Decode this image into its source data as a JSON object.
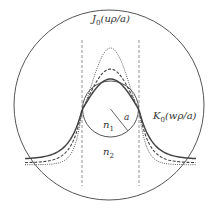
{
  "diagram": {
    "type": "optical-fiber-mode-field",
    "labels": {
      "bessel_j": {
        "main": "J",
        "sub": "0",
        "arg": "(uρ/a)"
      },
      "bessel_k": {
        "main": "K",
        "sub": "0",
        "arg": "(wρ/a)"
      },
      "radius": "a",
      "core_index": {
        "main": "n",
        "sub": "1"
      },
      "cladding_index": {
        "main": "n",
        "sub": "2"
      }
    },
    "curves": [
      {
        "name": "mode-profile-solid",
        "style": "solid",
        "relative_peak": 1.0,
        "tail_level": 0.33
      },
      {
        "name": "mode-profile-dashed",
        "style": "dashed",
        "relative_peak": 1.32,
        "tail_level": 0.22
      },
      {
        "name": "mode-profile-dotted",
        "style": "dotted",
        "relative_peak": 2.0,
        "tail_level": 0.16
      }
    ],
    "colors": {
      "line": "#555555",
      "text": "#333333",
      "background": "#ffffff"
    }
  }
}
